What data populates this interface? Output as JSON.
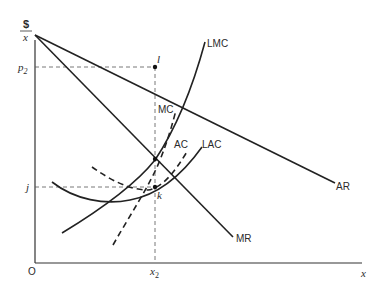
{
  "diagram": {
    "type": "economics cost and revenue curves",
    "axes": {
      "y_label_top": "$",
      "y_label_bottom": "x",
      "x_label": "x",
      "origin": "O"
    },
    "ticks": {
      "p2": "p",
      "p2_sub": "2",
      "j": "j",
      "x2": "x",
      "x2_sub": "2"
    },
    "points": {
      "l": "l",
      "k": "k"
    },
    "curves": {
      "AR": "AR",
      "MR": "MR",
      "LMC": "LMC",
      "MC": "MC",
      "AC": "AC",
      "LAC": "LAC"
    },
    "colors": {
      "line": "#222222",
      "background": "#ffffff"
    }
  }
}
